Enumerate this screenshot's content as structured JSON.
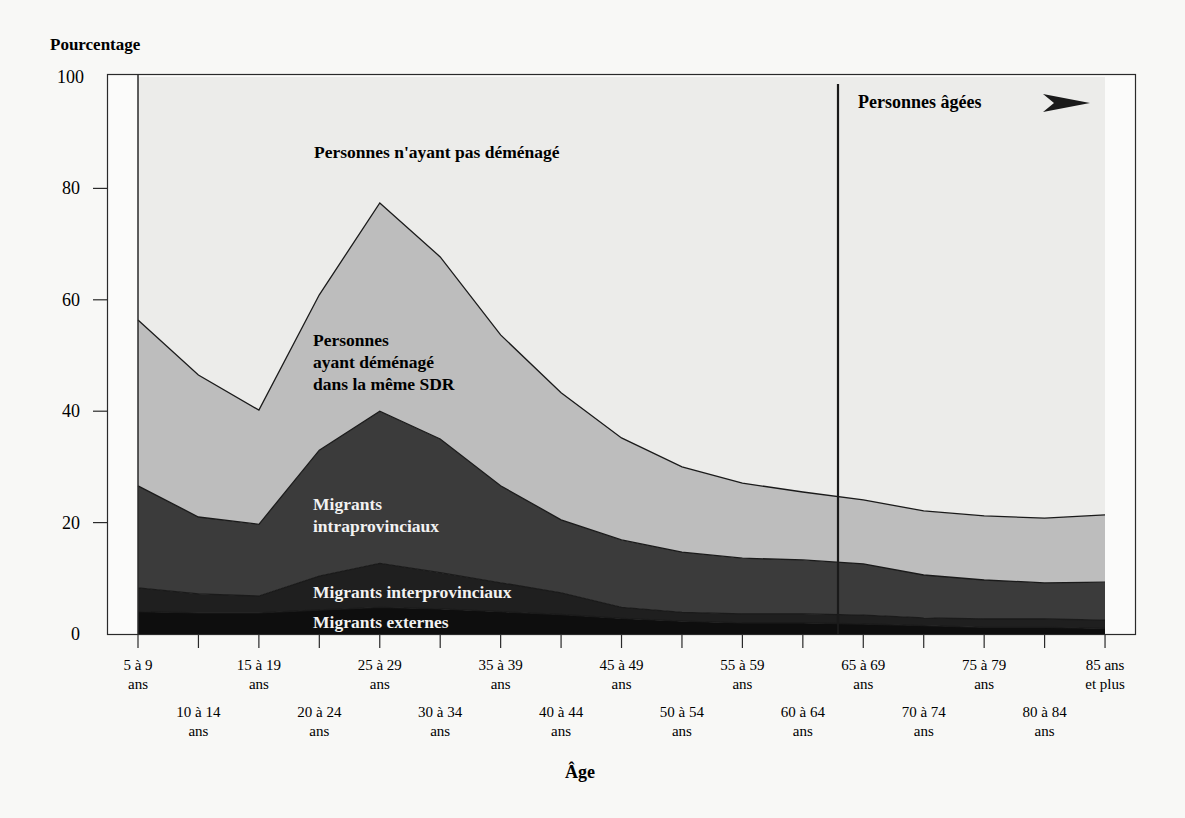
{
  "chart_data": {
    "type": "area",
    "stacked": true,
    "title": "",
    "ylabel": "Pourcentage",
    "xlabel": "Âge",
    "ylim": [
      0,
      100
    ],
    "yticks": [
      0,
      20,
      40,
      60,
      80,
      100
    ],
    "grid": false,
    "categories": [
      "5 à 9 ans",
      "10 à 14 ans",
      "15 à 19 ans",
      "20 à 24 ans",
      "25 à 29 ans",
      "30 à 34 ans",
      "35 à 39 ans",
      "40 à 44 ans",
      "45 à 49 ans",
      "50 à 54 ans",
      "55 à 59 ans",
      "60 à 64 ans",
      "65 à 69 ans",
      "70 à 74 ans",
      "75 à 79 ans",
      "80 à 84 ans",
      "85 ans et plus"
    ],
    "category_labels": [
      [
        "5 à 9",
        "ans"
      ],
      [
        "10 à 14",
        "ans"
      ],
      [
        "15 à 19",
        "ans"
      ],
      [
        "20 à 24",
        "ans"
      ],
      [
        "25 à 29",
        "ans"
      ],
      [
        "30 à 34",
        "ans"
      ],
      [
        "35 à 39",
        "ans"
      ],
      [
        "40 à 44",
        "ans"
      ],
      [
        "45 à 49",
        "ans"
      ],
      [
        "50 à 54",
        "ans"
      ],
      [
        "55 à 59",
        "ans"
      ],
      [
        "60 à 64",
        "ans"
      ],
      [
        "65 à 69",
        "ans"
      ],
      [
        "70 à 74",
        "ans"
      ],
      [
        "75 à 79",
        "ans"
      ],
      [
        "80 à 84",
        "ans"
      ],
      [
        "85 ans",
        "et plus"
      ]
    ],
    "series": [
      {
        "name": "Migrants externes",
        "color": "#0e0e0e",
        "label_color": "#f2f2f2",
        "values": [
          4.0,
          3.8,
          3.8,
          4.3,
          4.8,
          4.5,
          4.0,
          3.5,
          2.8,
          2.3,
          2.0,
          2.0,
          1.8,
          1.5,
          1.2,
          1.2,
          1.0
        ]
      },
      {
        "name": "Migrants interprovinciaux",
        "color": "#1f1f1f",
        "label_color": "#f2f2f2",
        "values": [
          4.3,
          3.4,
          3.0,
          6.1,
          7.9,
          6.5,
          5.2,
          3.9,
          2.0,
          1.6,
          1.6,
          1.6,
          1.6,
          1.4,
          1.5,
          1.5,
          1.5
        ]
      },
      {
        "name": "Migrants intraprovinciaux",
        "color": "#3b3b3b",
        "label_color": "#f2f2f2",
        "values": [
          18.3,
          13.8,
          12.9,
          22.6,
          27.3,
          24.0,
          17.4,
          13.1,
          12.1,
          10.8,
          10.0,
          9.7,
          9.2,
          7.7,
          7.0,
          6.5,
          6.8
        ]
      },
      {
        "name": "Personnes ayant déménagé dans la même SDR",
        "color": "#bdbdbd",
        "label_color": "#1a1a1a",
        "values": [
          29.8,
          25.5,
          20.5,
          27.9,
          37.4,
          32.7,
          27.1,
          22.8,
          18.3,
          15.3,
          13.5,
          12.2,
          11.5,
          11.5,
          11.5,
          11.6,
          12.1
        ]
      },
      {
        "name": "Personnes n'ayant pas déménagé",
        "color": "#ececea",
        "label_color": "#1a1a1a",
        "values": [
          43.6,
          53.5,
          59.8,
          39.1,
          22.6,
          32.3,
          46.3,
          56.7,
          64.8,
          70.0,
          72.9,
          74.5,
          75.9,
          77.9,
          78.8,
          79.2,
          78.6
        ]
      }
    ],
    "annotations": [
      {
        "text": "Personnes âgées",
        "type": "vertical-marker-with-arrow",
        "x_between": [
          "60 à 64 ans",
          "65 à 69 ans"
        ]
      }
    ],
    "legend": "inline-labels"
  },
  "labels": {
    "y_title": "Pourcentage",
    "x_title": "Âge",
    "elderly": "Personnes âgées",
    "non_movers": "Personnes n'ayant pas déménagé",
    "same_sdr": [
      "Personnes",
      "ayant déménagé",
      "dans la même SDR"
    ],
    "intraprov": [
      "Migrants",
      "intraprovinciaux"
    ],
    "interprov": "Migrants interprovinciaux",
    "external": "Migrants externes"
  }
}
